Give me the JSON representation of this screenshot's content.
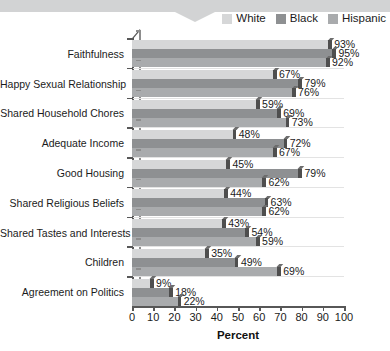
{
  "legend": {
    "items": [
      {
        "label": "White",
        "color": "#d6d7d8"
      },
      {
        "label": "Black",
        "color": "#8e9092"
      },
      {
        "label": "Hispanic",
        "color": "#a9abad"
      }
    ]
  },
  "chart_data": {
    "type": "bar",
    "orientation": "horizontal",
    "title": "",
    "xlabel": "Percent",
    "ylabel": "",
    "xlim": [
      0,
      100
    ],
    "xticks": [
      0,
      10,
      20,
      30,
      40,
      50,
      60,
      70,
      80,
      90,
      100
    ],
    "grid": false,
    "legend_position": "top-right",
    "value_suffix": "%",
    "categories": [
      "Faithfulness",
      "Happy Sexual Relationship",
      "Shared Household Chores",
      "Adequate Income",
      "Good Housing",
      "Shared Religious Beliefs",
      "Shared Tastes and Interests",
      "Children",
      "Agreement on Politics"
    ],
    "series": [
      {
        "name": "White",
        "color": "#d6d7d8",
        "values": [
          93,
          67,
          59,
          48,
          45,
          44,
          43,
          35,
          9
        ]
      },
      {
        "name": "Black",
        "color": "#8e9092",
        "values": [
          95,
          79,
          69,
          72,
          79,
          63,
          54,
          49,
          18
        ]
      },
      {
        "name": "Hispanic",
        "color": "#a9abad",
        "values": [
          92,
          76,
          73,
          67,
          62,
          62,
          59,
          69,
          22
        ]
      }
    ],
    "labels": {
      "Faithfulness": [
        "93%",
        "95%",
        "92%"
      ],
      "Happy Sexual Relationship": [
        "67%",
        "79%",
        "76%"
      ],
      "Shared Household Chores": [
        "59%",
        "69%",
        "73%"
      ],
      "Adequate Income": [
        "48%",
        "72%",
        "67%"
      ],
      "Good Housing": [
        "45%",
        "79%",
        "62%"
      ],
      "Shared Religious Beliefs": [
        "44%",
        "63%",
        "62%"
      ],
      "Shared Tastes and Interests": [
        "43%",
        "54%",
        "59%"
      ],
      "Children": [
        "35%",
        "49%",
        "69%"
      ],
      "Agreement on Politics": [
        "9%",
        "18%",
        "22%"
      ]
    }
  }
}
